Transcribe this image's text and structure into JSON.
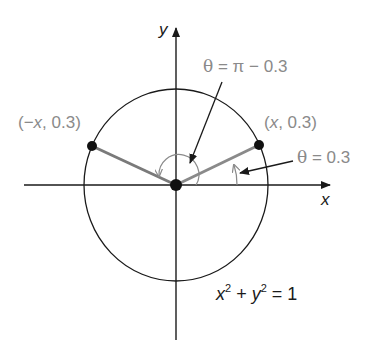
{
  "diagram": {
    "axes": {
      "x_label": "x",
      "y_label": "y"
    },
    "circle": {
      "equation_x": "x",
      "equation_plus": " + ",
      "equation_y": "y",
      "equation_exp": "2",
      "equation_rhs": " = 1"
    },
    "points": {
      "left": {
        "label": "(−x, 0.3)",
        "x_var": "x",
        "pre": "(−",
        "post": ", 0.3)"
      },
      "right": {
        "label": "(x, 0.3)",
        "x_var": "x",
        "pre": "(",
        "post": ", 0.3)"
      }
    },
    "angles": {
      "large": {
        "theta": "θ",
        "expr": " = π − 0.3"
      },
      "small": {
        "theta": "θ",
        "expr": " = 0.3"
      }
    },
    "colors": {
      "axis": "#1a1a1a",
      "circle": "#1a1a1a",
      "ray": "#7a7a7a",
      "label_gray": "#8a8a8a",
      "point": "#111111"
    }
  }
}
